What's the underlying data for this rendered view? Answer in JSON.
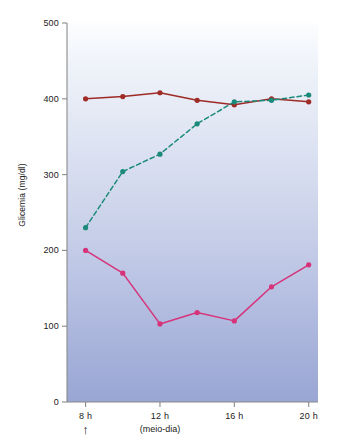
{
  "chart_data": {
    "type": "line",
    "title": "",
    "xlabel": "",
    "ylabel": "Glicemia (mg/dl)",
    "xlim": [
      7,
      20.5
    ],
    "ylim": [
      0,
      500
    ],
    "grid": false,
    "legend": "none",
    "background": {
      "gradient_top": "#fbfcfe",
      "gradient_bottom": "#9aa6d4"
    },
    "x_ticks": [
      {
        "value": 8,
        "label": "8 h"
      },
      {
        "value": 12,
        "label": "12 h"
      },
      {
        "value": 16,
        "label": "16 h"
      },
      {
        "value": 20,
        "label": "20 h"
      }
    ],
    "y_ticks": [
      {
        "value": 0,
        "label": "0"
      },
      {
        "value": 100,
        "label": "100"
      },
      {
        "value": 200,
        "label": "200"
      },
      {
        "value": 300,
        "label": "300"
      },
      {
        "value": 400,
        "label": "400"
      },
      {
        "value": 500,
        "label": "500"
      }
    ],
    "annotations": [
      {
        "name": "noon-note",
        "text": "(meio-dia)",
        "x": 12
      },
      {
        "name": "arrow-marker",
        "text": "↑",
        "x": 8
      }
    ],
    "series": [
      {
        "name": "serie-vermelha",
        "color": "#9e2b25",
        "style": "solid",
        "marker": "circle",
        "x": [
          8,
          10,
          12,
          14,
          16,
          18,
          20
        ],
        "values": [
          400,
          403,
          408,
          398,
          392,
          400,
          396
        ]
      },
      {
        "name": "serie-verde-tracejada",
        "color": "#1b8a7a",
        "style": "dashed",
        "marker": "circle",
        "x": [
          8,
          10,
          12,
          14,
          16,
          18,
          20
        ],
        "values": [
          230,
          304,
          327,
          367,
          396,
          398,
          405
        ]
      },
      {
        "name": "serie-rosa",
        "color": "#d6337a",
        "style": "solid",
        "marker": "circle",
        "x": [
          8,
          10,
          12,
          14,
          16,
          18,
          20
        ],
        "values": [
          200,
          170,
          103,
          118,
          107,
          152,
          181
        ]
      }
    ]
  }
}
